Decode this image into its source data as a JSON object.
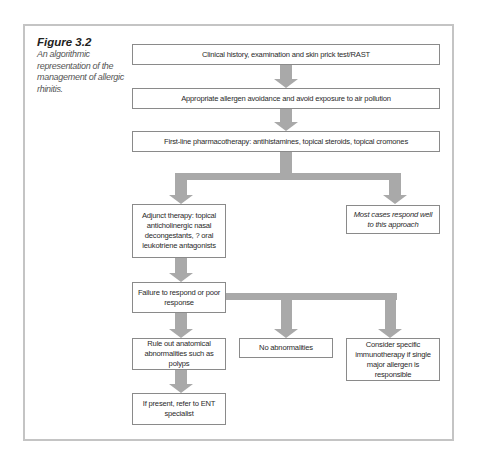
{
  "figure": {
    "label": "Figure 3.2",
    "caption": "An algorithmic representation of the management of allergic rhinitis.",
    "caption_lines": [
      "An algorithmic",
      "representation of the",
      "management of allergic",
      "rhinitis."
    ]
  },
  "nodes": {
    "clinical_history": "Clinical history, examination and skin prick test/RAST",
    "allergen_avoidance": "Appropriate allergen avoidance and avoid exposure to air pollution",
    "first_line": "First-line pharmacotherapy: antihistamines, topical steroids, topical cromones",
    "adjunct": "Adjunct therapy: topical anticholinergic nasal decongestants, ? oral leukotriene antagonists",
    "most_cases": "Most cases respond well to this approach",
    "failure": "Failure to respond or poor response",
    "rule_out": "Rule out anatomical abnormalities such as polyps",
    "no_abnormalities": "No abnormalities",
    "immunotherapy": "Consider specific immunotherapy if single major allergen is responsible",
    "ent": "If present, refer to ENT specialist"
  },
  "edges": [
    {
      "from": "clinical_history",
      "to": "allergen_avoidance"
    },
    {
      "from": "allergen_avoidance",
      "to": "first_line"
    },
    {
      "from": "first_line",
      "to": "adjunct"
    },
    {
      "from": "first_line",
      "to": "most_cases"
    },
    {
      "from": "adjunct",
      "to": "failure"
    },
    {
      "from": "failure",
      "to": "rule_out"
    },
    {
      "from": "failure",
      "to": "no_abnormalities"
    },
    {
      "from": "failure",
      "to": "immunotherapy"
    },
    {
      "from": "rule_out",
      "to": "ent"
    }
  ],
  "colors": {
    "arrow": "#a9a9a9",
    "box_border": "#8a8a8a",
    "frame_border": "#c4c4c4"
  }
}
